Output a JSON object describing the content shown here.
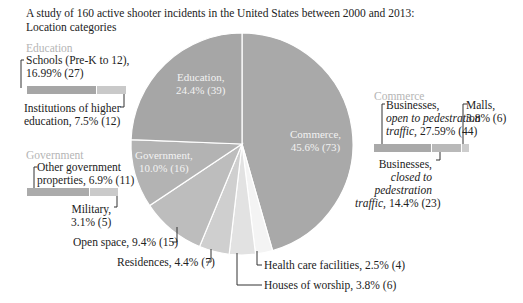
{
  "chart_data": {
    "type": "pie",
    "title": "A study of 160 active shooter incidents in the United States between 2000 and 2013: Location categories",
    "total_incidents": 160,
    "slices": [
      {
        "label": "Commerce",
        "percent": 45.6,
        "count": 73,
        "color": "#a9a9a9"
      },
      {
        "label": "Health care facilities",
        "percent": 2.5,
        "count": 4,
        "color": "#f4f4f4"
      },
      {
        "label": "Houses of worship",
        "percent": 3.8,
        "count": 6,
        "color": "#e2e2e2"
      },
      {
        "label": "Residences",
        "percent": 4.4,
        "count": 7,
        "color": "#cfcfcf"
      },
      {
        "label": "Open space",
        "percent": 9.4,
        "count": 15,
        "color": "#bdbdbd"
      },
      {
        "label": "Government",
        "percent": 10.0,
        "count": 16,
        "color": "#b3b3b3"
      },
      {
        "label": "Education",
        "percent": 24.4,
        "count": 39,
        "color": "#a6a6a6"
      }
    ],
    "breakdowns": [
      {
        "group": "Education",
        "items": [
          {
            "label": "Schools (Pre-K to 12)",
            "percent": 16.99,
            "count": 27
          },
          {
            "label": "Institutions of higher education",
            "percent": 7.5,
            "count": 12
          }
        ]
      },
      {
        "group": "Government",
        "items": [
          {
            "label": "Other government properties",
            "percent": 6.9,
            "count": 11
          },
          {
            "label": "Military",
            "percent": 3.1,
            "count": 5
          }
        ]
      },
      {
        "group": "Commerce",
        "items": [
          {
            "label": "Businesses, open to pedestration traffic",
            "percent": 27.59,
            "count": 44
          },
          {
            "label": "Businesses, closed to pedestration traffic",
            "percent": 14.4,
            "count": 23
          },
          {
            "label": "Malls",
            "percent": 3.8,
            "count": 6
          }
        ]
      }
    ]
  },
  "title": {
    "line1": "A study of 160 active shooter incidents in the United States between 2000 and 2013:",
    "line2": "Location categories"
  },
  "pie_labels": {
    "education": {
      "name": "Education,",
      "value": "24.4% (39)"
    },
    "commerce": {
      "name": "Commerce,",
      "value": "45.6% (73)"
    },
    "government": {
      "name": "Government,",
      "value": "10.0% (16)"
    }
  },
  "callouts": {
    "open_space": "Open space, 9.4% (15)",
    "residences": "Residences, 4.4% (7)",
    "health_care": "Health care facilities, 2.5% (4)",
    "houses_of_worship": "Houses of worship, 3.8% (6)"
  },
  "education_group": {
    "title": "Education",
    "schools_l1": "Schools (Pre-K to 12),",
    "schools_l2": "16.99% (27)",
    "higher_l1": "Institutions of higher",
    "higher_l2": "education, 7.5% (12)"
  },
  "government_group": {
    "title": "Government",
    "other_l1": "Other government",
    "other_l2": "properties, 6.9% (11)",
    "military_l1": "Military,",
    "military_l2": "3.1% (5)"
  },
  "commerce_group": {
    "title": "Commerce",
    "open_l1": "Businesses,",
    "open_l2": "open to pedestration",
    "open_l3a": "traffic,",
    "open_l3b": " 27.59% (44)",
    "malls_l1": "Malls,",
    "malls_l2": "3.8% (6)",
    "closed_l1": "Businesses,",
    "closed_l2": "closed to",
    "closed_l3": "pedestration",
    "closed_l4a": "traffic,",
    "closed_l4b": " 14.4% (23)"
  }
}
